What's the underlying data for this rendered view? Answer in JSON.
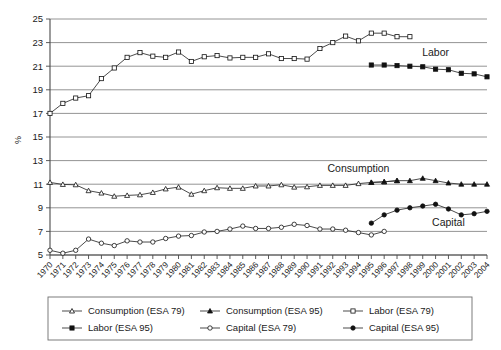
{
  "chart_data": {
    "type": "line",
    "title": "",
    "xlabel": "",
    "ylabel": "%",
    "ylim": [
      5,
      25
    ],
    "ytick_values": [
      5,
      7,
      9,
      11,
      13,
      15,
      17,
      19,
      21,
      23,
      25
    ],
    "grid": true,
    "legend_position": "bottom",
    "x": [
      1970,
      1971,
      1972,
      1973,
      1974,
      1975,
      1976,
      1977,
      1978,
      1979,
      1980,
      1981,
      1982,
      1983,
      1984,
      1985,
      1986,
      1987,
      1988,
      1989,
      1990,
      1991,
      1992,
      1993,
      1994,
      1995,
      1996,
      1997,
      1998,
      1999,
      2000,
      2001,
      2002,
      2003,
      2004
    ],
    "categories": [
      "1970",
      "1971",
      "1972",
      "1973",
      "1974",
      "1975",
      "1976",
      "1977",
      "1978",
      "1979",
      "1980",
      "1981",
      "1982",
      "1983",
      "1984",
      "1985",
      "1986",
      "1987",
      "1988",
      "1989",
      "1990",
      "1991",
      "1992",
      "1993",
      "1994",
      "1995",
      "1996",
      "1997",
      "1998",
      "1999",
      "2000",
      "2001",
      "2002",
      "2003",
      "2004"
    ],
    "annotations": [
      {
        "text": "Labor",
        "x": 2000,
        "y": 21.9
      },
      {
        "text": "Consumption",
        "x": 1994,
        "y": 12.0
      },
      {
        "text": "Capital",
        "x": 2001,
        "y": 7.5
      }
    ],
    "series": [
      {
        "name": "Consumption (ESA 79)",
        "marker": "open-triangle",
        "x": [
          1970,
          1971,
          1972,
          1973,
          1974,
          1975,
          1976,
          1977,
          1978,
          1979,
          1980,
          1981,
          1982,
          1983,
          1984,
          1985,
          1986,
          1987,
          1988,
          1989,
          1990,
          1991,
          1992,
          1993,
          1994,
          1995,
          1996,
          1997
        ],
        "values": [
          11.15,
          10.98,
          10.95,
          10.45,
          10.25,
          9.98,
          10.05,
          10.1,
          10.3,
          10.6,
          10.75,
          10.15,
          10.45,
          10.7,
          10.65,
          10.65,
          10.85,
          10.85,
          10.95,
          10.75,
          10.78,
          10.9,
          10.9,
          10.9,
          11.05,
          11.15,
          11.2,
          11.3
        ]
      },
      {
        "name": "Consumption (ESA 95)",
        "marker": "filled-triangle",
        "x": [
          1995,
          1996,
          1997,
          1998,
          1999,
          2000,
          2001,
          2002,
          2003,
          2004
        ],
        "values": [
          11.15,
          11.2,
          11.3,
          11.3,
          11.5,
          11.3,
          11.1,
          11.0,
          11.0,
          11.0
        ]
      },
      {
        "name": "Labor (ESA 79)",
        "marker": "open-square",
        "x": [
          1970,
          1971,
          1972,
          1973,
          1974,
          1975,
          1976,
          1977,
          1978,
          1979,
          1980,
          1981,
          1982,
          1983,
          1984,
          1985,
          1986,
          1987,
          1988,
          1989,
          1990,
          1991,
          1992,
          1993,
          1994,
          1995,
          1996,
          1997,
          1998
        ],
        "values": [
          17.0,
          17.85,
          18.3,
          18.5,
          19.95,
          20.85,
          21.75,
          22.15,
          21.85,
          21.75,
          22.2,
          21.4,
          21.8,
          21.9,
          21.7,
          21.75,
          21.75,
          22.05,
          21.65,
          21.65,
          21.6,
          22.5,
          23.0,
          23.55,
          23.15,
          23.8,
          23.8,
          23.5,
          23.5
        ]
      },
      {
        "name": "Labor (ESA 95)",
        "marker": "filled-square",
        "x": [
          1995,
          1996,
          1997,
          1998,
          1999,
          2000,
          2001,
          2002,
          2003,
          2004
        ],
        "values": [
          21.1,
          21.1,
          21.05,
          21.0,
          20.95,
          20.75,
          20.7,
          20.4,
          20.35,
          20.1
        ]
      },
      {
        "name": "Capital (ESA 79)",
        "marker": "open-circle",
        "x": [
          1970,
          1971,
          1972,
          1973,
          1974,
          1975,
          1976,
          1977,
          1978,
          1979,
          1980,
          1981,
          1982,
          1983,
          1984,
          1985,
          1986,
          1987,
          1988,
          1989,
          1990,
          1991,
          1992,
          1993,
          1994,
          1995,
          1996
        ],
        "values": [
          5.4,
          5.15,
          5.4,
          6.35,
          6.0,
          5.8,
          6.2,
          6.1,
          6.1,
          6.4,
          6.6,
          6.65,
          6.95,
          7.0,
          7.2,
          7.45,
          7.25,
          7.25,
          7.35,
          7.6,
          7.5,
          7.2,
          7.2,
          7.1,
          6.9,
          6.7,
          7.0
        ]
      },
      {
        "name": "Capital (ESA 95)",
        "marker": "filled-circle",
        "x": [
          1995,
          1996,
          1997,
          1998,
          1999,
          2000,
          2001,
          2002,
          2003,
          2004
        ],
        "values": [
          7.7,
          8.4,
          8.8,
          9.0,
          9.15,
          9.3,
          8.9,
          8.4,
          8.5,
          8.7
        ]
      }
    ]
  },
  "legend": {
    "entries": [
      {
        "label": "Consumption (ESA 79)",
        "marker": "open-triangle"
      },
      {
        "label": "Consumption (ESA 95)",
        "marker": "filled-triangle"
      },
      {
        "label": "Labor (ESA 79)",
        "marker": "open-square"
      },
      {
        "label": "Labor (ESA 95)",
        "marker": "filled-square"
      },
      {
        "label": "Capital (ESA 79)",
        "marker": "open-circle"
      },
      {
        "label": "Capital (ESA 95)",
        "marker": "filled-circle"
      }
    ]
  },
  "colors": {
    "line": "#2b2b2b",
    "grid": "#888888",
    "axis": "#4a4a4a",
    "text": "#1a1a1a",
    "background": "#ffffff"
  }
}
